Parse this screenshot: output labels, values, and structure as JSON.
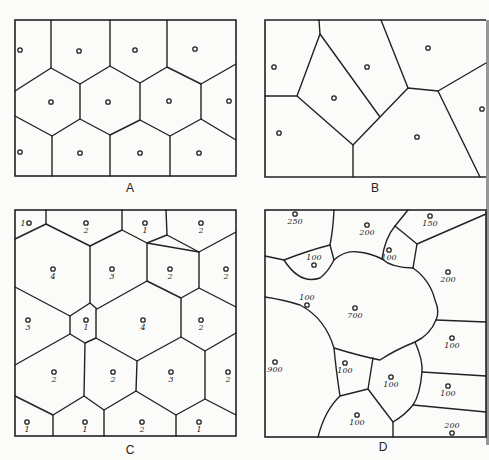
{
  "figure": {
    "panels": [
      {
        "id": "A",
        "caption": "A",
        "points": [
          {
            "x": 20,
            "y": 50
          },
          {
            "x": 79,
            "y": 51
          },
          {
            "x": 135,
            "y": 50
          },
          {
            "x": 195,
            "y": 49
          },
          {
            "x": 51,
            "y": 102
          },
          {
            "x": 108,
            "y": 102
          },
          {
            "x": 169,
            "y": 101
          },
          {
            "x": 229,
            "y": 101
          },
          {
            "x": 20,
            "y": 152
          },
          {
            "x": 80,
            "y": 153
          },
          {
            "x": 140,
            "y": 153
          },
          {
            "x": 199,
            "y": 153
          }
        ]
      },
      {
        "id": "B",
        "caption": "B",
        "points": [
          {
            "x": 274,
            "y": 67
          },
          {
            "x": 367,
            "y": 67
          },
          {
            "x": 428,
            "y": 48
          },
          {
            "x": 334,
            "y": 98
          },
          {
            "x": 482,
            "y": 109
          },
          {
            "x": 279,
            "y": 133
          },
          {
            "x": 417,
            "y": 137
          }
        ]
      },
      {
        "id": "C",
        "caption": "C",
        "points": [
          {
            "x": 29,
            "y": 223,
            "value": "1"
          },
          {
            "x": 86,
            "y": 223,
            "value": "2"
          },
          {
            "x": 145,
            "y": 223,
            "value": "1"
          },
          {
            "x": 201,
            "y": 223,
            "value": "2"
          },
          {
            "x": 53,
            "y": 269,
            "value": "4"
          },
          {
            "x": 112,
            "y": 269,
            "value": "3"
          },
          {
            "x": 170,
            "y": 269,
            "value": "2"
          },
          {
            "x": 226,
            "y": 269,
            "value": "2"
          },
          {
            "x": 28,
            "y": 320,
            "value": "3"
          },
          {
            "x": 86,
            "y": 320,
            "value": "1"
          },
          {
            "x": 143,
            "y": 320,
            "value": "4"
          },
          {
            "x": 201,
            "y": 320,
            "value": "2"
          },
          {
            "x": 54,
            "y": 372,
            "value": "2"
          },
          {
            "x": 113,
            "y": 372,
            "value": "2"
          },
          {
            "x": 171,
            "y": 372,
            "value": "3"
          },
          {
            "x": 228,
            "y": 372,
            "value": "2"
          },
          {
            "x": 27,
            "y": 422,
            "value": "1"
          },
          {
            "x": 85,
            "y": 422,
            "value": "1"
          },
          {
            "x": 142,
            "y": 422,
            "value": "2"
          },
          {
            "x": 199,
            "y": 422,
            "value": "1"
          }
        ]
      },
      {
        "id": "D",
        "caption": "D",
        "points": [
          {
            "x": 295,
            "y": 214,
            "value": "250",
            "label_below": true
          },
          {
            "x": 367,
            "y": 225,
            "value": "200",
            "label_below": true
          },
          {
            "x": 430,
            "y": 216,
            "value": "150",
            "label_below": true
          },
          {
            "x": 314,
            "y": 265,
            "value": "100",
            "label_above": true
          },
          {
            "x": 389,
            "y": 250,
            "value": "100",
            "label_below": true
          },
          {
            "x": 448,
            "y": 272,
            "value": "200",
            "label_below": true
          },
          {
            "x": 307,
            "y": 305,
            "value": "100",
            "label_above": true
          },
          {
            "x": 355,
            "y": 308,
            "value": "700",
            "label_below": true
          },
          {
            "x": 452,
            "y": 338,
            "value": "100",
            "label_below": true
          },
          {
            "x": 275,
            "y": 362,
            "value": "900",
            "label_below": true
          },
          {
            "x": 345,
            "y": 363,
            "value": "100",
            "label_below": true
          },
          {
            "x": 391,
            "y": 377,
            "value": "100",
            "label_below": true
          },
          {
            "x": 448,
            "y": 386,
            "value": "100",
            "label_below": true
          },
          {
            "x": 357,
            "y": 415,
            "value": "100",
            "label_below": true
          },
          {
            "x": 452,
            "y": 433,
            "value": "200",
            "label_above": true
          }
        ]
      }
    ]
  }
}
